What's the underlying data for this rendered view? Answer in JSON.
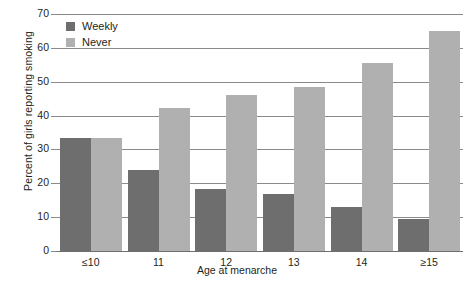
{
  "chart_data": {
    "type": "bar",
    "title": "",
    "xlabel": "Age at menarche",
    "ylabel": "Percent of girls reporting smoking",
    "categories": [
      "≤10",
      "11",
      "12",
      "13",
      "14",
      "≥15"
    ],
    "series": [
      {
        "name": "Weekly",
        "color": "#6e6e6e",
        "values": [
          33.4,
          23.8,
          18.4,
          16.8,
          13.0,
          9.4
        ]
      },
      {
        "name": "Never",
        "color": "#b0b0b0",
        "values": [
          33.4,
          42.2,
          46.0,
          48.3,
          55.5,
          65.0
        ]
      }
    ],
    "ylim": [
      0,
      70
    ],
    "ytick_values": [
      0,
      10,
      20,
      30,
      40,
      50,
      60,
      70
    ],
    "ytick_labels": [
      "0",
      "10",
      "20",
      "30",
      "40",
      "50",
      "60",
      "70"
    ],
    "grid": "horizontal",
    "legend_position": "top-left"
  },
  "legend": {
    "items": [
      {
        "label": "Weekly"
      },
      {
        "label": "Never"
      }
    ]
  },
  "axes": {
    "y_title": "Percent of girls reporting smoking",
    "x_title": "Age at menarche"
  }
}
